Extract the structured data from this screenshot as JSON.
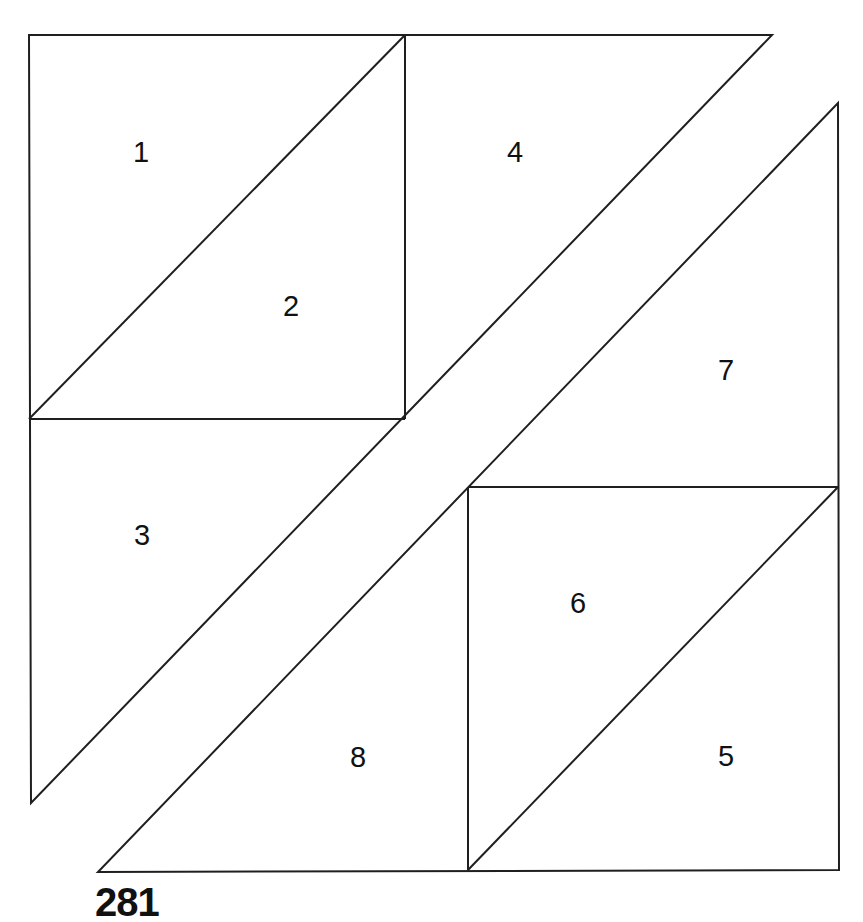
{
  "page": {
    "background_color": "#ffffff",
    "line_color": "#1f1f1f",
    "label_color": "#111111",
    "page_number": "281"
  },
  "diagram": {
    "width": 863,
    "height": 922,
    "line_width": 2,
    "label_font_size": 29,
    "figures": [
      {
        "name": "upper-left-triangle-figure",
        "outline": [
          [
            29,
            35
          ],
          [
            772,
            35
          ],
          [
            31,
            803
          ]
        ],
        "inner_lines": [
          {
            "name": "square-a-right-edge",
            "from": [
              405,
              35
            ],
            "to": [
              405,
              419
            ]
          },
          {
            "name": "square-a-bottom-edge",
            "from": [
              29,
              419
            ],
            "to": [
              405,
              419
            ]
          },
          {
            "name": "square-a-diagonal",
            "from": [
              29,
              419
            ],
            "to": [
              405,
              35
            ]
          }
        ]
      },
      {
        "name": "lower-right-triangle-figure",
        "outline": [
          [
            838,
            103
          ],
          [
            839,
            870
          ],
          [
            98,
            872
          ]
        ],
        "inner_lines": [
          {
            "name": "square-b-top-edge",
            "from": [
              468,
              487
            ],
            "to": [
              838,
              487
            ]
          },
          {
            "name": "square-b-left-edge",
            "from": [
              468,
              487
            ],
            "to": [
              468,
              870
            ]
          },
          {
            "name": "square-b-diagonal",
            "from": [
              468,
              870
            ],
            "to": [
              838,
              487
            ]
          }
        ]
      }
    ],
    "labels": [
      {
        "text": "1",
        "x": 141,
        "y": 152
      },
      {
        "text": "2",
        "x": 291,
        "y": 306
      },
      {
        "text": "3",
        "x": 142,
        "y": 535
      },
      {
        "text": "4",
        "x": 515,
        "y": 152
      },
      {
        "text": "5",
        "x": 726,
        "y": 756
      },
      {
        "text": "6",
        "x": 578,
        "y": 603
      },
      {
        "text": "7",
        "x": 726,
        "y": 370
      },
      {
        "text": "8",
        "x": 358,
        "y": 757
      }
    ]
  }
}
